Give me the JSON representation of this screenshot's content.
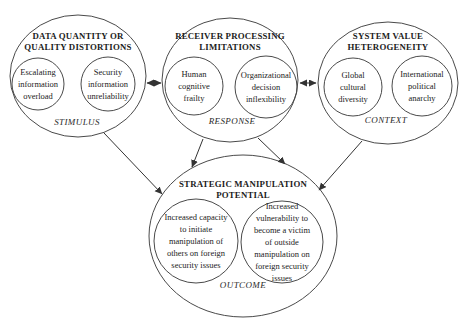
{
  "diagram": {
    "colors": {
      "line": "#4a4a4a",
      "arrow": "#333333",
      "text": "#1c1c1c",
      "background": "#ffffff"
    },
    "nodes": {
      "stimulus": {
        "title": "DATA QUANTITY OR\nQUALITY DISTORTIONS",
        "circle1": "Escalating\ninformation\noverload",
        "circle2": "Security\ninformation\nunreliability",
        "label": "STIMULUS"
      },
      "response": {
        "title": "RECEIVER PROCESSING\nLIMITATIONS",
        "circle1": "Human\ncognitive\nfrailty",
        "circle2": "Organizational\ndecision\ninflexibility",
        "label": "RESPONSE"
      },
      "context": {
        "title": "SYSTEM VALUE\nHETEROGENEITY",
        "circle1": "Global\ncultural\ndiversity",
        "circle2": "International\npolitical\nanarchy",
        "label": "CONTEXT"
      },
      "outcome": {
        "title": "STRATEGIC MANIPULATION\nPOTENTIAL",
        "circle1": "Increased capacity\nto initiate\nmanipulation of\nothers on foreign\nsecurity issues",
        "circle2": "Increased\nvulnerability to\nbecome a victim\nof outside\nmanipulation on\nforeign security\nissues",
        "label": "OUTCOME"
      }
    },
    "connections": [
      {
        "from": "stimulus",
        "to": "response",
        "type": "bidirectional"
      },
      {
        "from": "response",
        "to": "context",
        "type": "bidirectional"
      },
      {
        "from": "stimulus",
        "to": "outcome",
        "type": "directed"
      },
      {
        "from": "response",
        "to": "outcome",
        "type": "directed"
      },
      {
        "from": "response",
        "to": "outcome",
        "type": "directed"
      },
      {
        "from": "context",
        "to": "outcome",
        "type": "directed"
      }
    ]
  }
}
